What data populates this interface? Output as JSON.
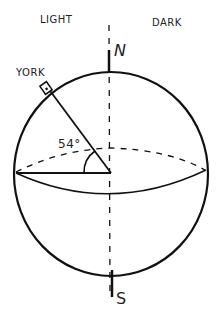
{
  "labels": {
    "light": "LIGHT",
    "dark": "DARK",
    "north": "N",
    "south": "S",
    "city": "YORK",
    "angle": "54°"
  },
  "diagram": {
    "type": "globe-latitude",
    "latitude_deg": 54,
    "stroke_color": "#111111"
  }
}
